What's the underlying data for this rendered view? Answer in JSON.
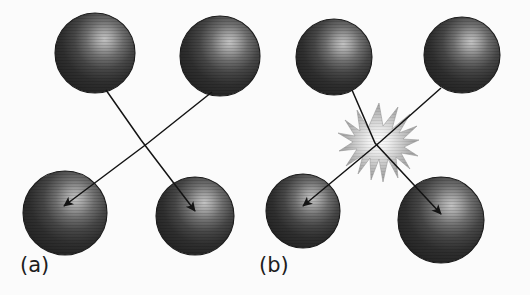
{
  "figure": {
    "background_color": "#fbfbfb",
    "width": 530,
    "height": 295,
    "sphere_fill_dark": "#2a2a2a",
    "sphere_fill_mid": "#3d3d3d",
    "sphere_highlight": "#b0b0b0",
    "sphere_edge": "#1b1b1b",
    "arrow_color": "#141414",
    "burst_center_color": "#f2f2f2",
    "burst_mid_color": "#b9b9b9",
    "burst_edge_color": "#8a8a8a"
  },
  "panels": [
    {
      "id": "a",
      "label": "(a)",
      "caption_text": "(a)",
      "spheres": [
        {
          "name": "sphere-top-left",
          "cx": 95,
          "cy": 53,
          "r": 40
        },
        {
          "name": "sphere-top-right",
          "cx": 220,
          "cy": 56,
          "r": 40
        },
        {
          "name": "sphere-bottom-left",
          "cx": 65,
          "cy": 213,
          "r": 42
        },
        {
          "name": "sphere-bottom-right",
          "cx": 195,
          "cy": 216,
          "r": 39
        }
      ],
      "arrows": [
        {
          "name": "arrow-top-right-to-bottom-left",
          "path": "M 212,92 L 148,143 L 64,206",
          "tip_x": 64,
          "tip_y": 206
        },
        {
          "name": "arrow-top-left-to-bottom-right",
          "path": "M 106,90 L 141,140 L 195,211",
          "tip_x": 195,
          "tip_y": 211
        }
      ],
      "burst": null
    },
    {
      "id": "b",
      "label": "(b)",
      "caption_text": "(b)",
      "spheres": [
        {
          "name": "sphere-top-left",
          "cx": 334,
          "cy": 57,
          "r": 38
        },
        {
          "name": "sphere-top-right",
          "cx": 462,
          "cy": 55,
          "r": 38
        },
        {
          "name": "sphere-bottom-left",
          "cx": 303,
          "cy": 211,
          "r": 37
        },
        {
          "name": "sphere-bottom-right",
          "cx": 441,
          "cy": 220,
          "r": 43
        }
      ],
      "arrows": [
        {
          "name": "arrow-top-right-to-bottom-left",
          "path": "M 441,88 L 380,142 L 303,206",
          "tip_x": 303,
          "tip_y": 206
        },
        {
          "name": "arrow-top-left-to-bottom-right",
          "path": "M 352,90 L 375,143 L 441,214",
          "tip_x": 441,
          "tip_y": 214
        }
      ],
      "burst": {
        "name": "collision-burst",
        "cx": 379,
        "cy": 143,
        "outer_r": 40,
        "inner_r": 15,
        "spikes": 22
      }
    }
  ]
}
